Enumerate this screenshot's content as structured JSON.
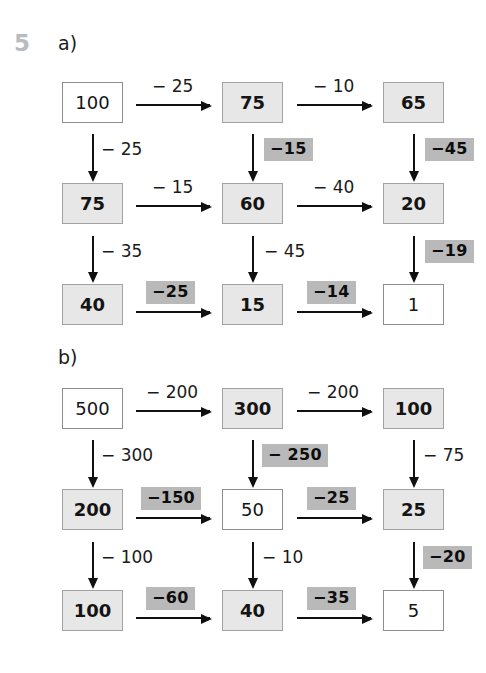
{
  "exercise": {
    "number": "5",
    "parts": [
      {
        "id": "a",
        "label": "a)"
      },
      {
        "id": "b",
        "label": "b)"
      }
    ]
  },
  "colors": {
    "box_shaded_fill": "#e7e7e7",
    "box_border": "#8d8d8d",
    "highlight_fill": "#b9b9b9",
    "exercise_number": "#b9bcbe",
    "text": "#1a1a1a",
    "page_background": "#ffffff"
  },
  "part_a": {
    "label": "a)",
    "boxes": [
      {
        "id": "a-r1c1",
        "value": "100",
        "shaded": false
      },
      {
        "id": "a-r1c2",
        "value": "75",
        "shaded": true
      },
      {
        "id": "a-r1c3",
        "value": "65",
        "shaded": true
      },
      {
        "id": "a-r2c1",
        "value": "75",
        "shaded": true
      },
      {
        "id": "a-r2c2",
        "value": "60",
        "shaded": true
      },
      {
        "id": "a-r2c3",
        "value": "20",
        "shaded": true
      },
      {
        "id": "a-r3c1",
        "value": "40",
        "shaded": true
      },
      {
        "id": "a-r3c2",
        "value": "15",
        "shaded": true
      },
      {
        "id": "a-r3c3",
        "value": "1",
        "shaded": false
      }
    ],
    "operations": [
      {
        "id": "a-h-r1-1",
        "value": "− 25",
        "highlighted": false,
        "direction": "right"
      },
      {
        "id": "a-h-r1-2",
        "value": "− 10",
        "highlighted": false,
        "direction": "right"
      },
      {
        "id": "a-h-r2-1",
        "value": "− 15",
        "highlighted": false,
        "direction": "right"
      },
      {
        "id": "a-h-r2-2",
        "value": "− 40",
        "highlighted": false,
        "direction": "right"
      },
      {
        "id": "a-h-r3-1",
        "value": "−25",
        "highlighted": true,
        "direction": "right"
      },
      {
        "id": "a-h-r3-2",
        "value": "−14",
        "highlighted": true,
        "direction": "right"
      },
      {
        "id": "a-v-c1-1",
        "value": "− 25",
        "highlighted": false,
        "direction": "down"
      },
      {
        "id": "a-v-c1-2",
        "value": "− 35",
        "highlighted": false,
        "direction": "down"
      },
      {
        "id": "a-v-c2-1",
        "value": "−15",
        "highlighted": true,
        "direction": "down"
      },
      {
        "id": "a-v-c2-2",
        "value": "− 45",
        "highlighted": false,
        "direction": "down"
      },
      {
        "id": "a-v-c3-1",
        "value": "−45",
        "highlighted": true,
        "direction": "down"
      },
      {
        "id": "a-v-c3-2",
        "value": "−19",
        "highlighted": true,
        "direction": "down"
      }
    ]
  },
  "part_b": {
    "label": "b)",
    "boxes": [
      {
        "id": "b-r1c1",
        "value": "500",
        "shaded": false
      },
      {
        "id": "b-r1c2",
        "value": "300",
        "shaded": true
      },
      {
        "id": "b-r1c3",
        "value": "100",
        "shaded": true
      },
      {
        "id": "b-r2c1",
        "value": "200",
        "shaded": true
      },
      {
        "id": "b-r2c2",
        "value": "50",
        "shaded": false
      },
      {
        "id": "b-r2c3",
        "value": "25",
        "shaded": true
      },
      {
        "id": "b-r3c1",
        "value": "100",
        "shaded": true
      },
      {
        "id": "b-r3c2",
        "value": "40",
        "shaded": true
      },
      {
        "id": "b-r3c3",
        "value": "5",
        "shaded": false
      }
    ],
    "operations": [
      {
        "id": "b-h-r1-1",
        "value": "− 200",
        "highlighted": false,
        "direction": "right"
      },
      {
        "id": "b-h-r1-2",
        "value": "− 200",
        "highlighted": false,
        "direction": "right"
      },
      {
        "id": "b-h-r2-1",
        "value": "−150",
        "highlighted": true,
        "direction": "right"
      },
      {
        "id": "b-h-r2-2",
        "value": "−25",
        "highlighted": true,
        "direction": "right"
      },
      {
        "id": "b-h-r3-1",
        "value": "−60",
        "highlighted": true,
        "direction": "right"
      },
      {
        "id": "b-h-r3-2",
        "value": "−35",
        "highlighted": true,
        "direction": "right"
      },
      {
        "id": "b-v-c1-1",
        "value": "− 300",
        "highlighted": false,
        "direction": "down"
      },
      {
        "id": "b-v-c1-2",
        "value": "− 100",
        "highlighted": false,
        "direction": "down"
      },
      {
        "id": "b-v-c2-1",
        "value": "− 250",
        "highlighted": true,
        "direction": "down"
      },
      {
        "id": "b-v-c2-2",
        "value": "− 10",
        "highlighted": false,
        "direction": "down"
      },
      {
        "id": "b-v-c3-1",
        "value": "− 75",
        "highlighted": false,
        "direction": "down"
      },
      {
        "id": "b-v-c3-2",
        "value": "−20",
        "highlighted": true,
        "direction": "down"
      }
    ]
  }
}
